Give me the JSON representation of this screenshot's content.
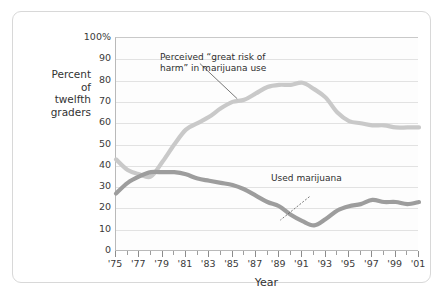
{
  "figure": {
    "y_axis_title_lines": [
      "Percent",
      "of",
      "twelfth",
      "graders"
    ],
    "x_axis_title": "Year",
    "annotations": {
      "risk": "Perceived “great risk of\nharm” in marijuana use",
      "use": "Used marijuana"
    }
  },
  "colors": {
    "risk_line": "#c9c9c9",
    "use_line": "#9d9d9d",
    "grid": "#e2e2e2",
    "axis": "#b9b9b9",
    "frame": "#d8d8d8",
    "text": "#3a3a3a",
    "plot_background": "#fdfdfd"
  },
  "chart_data": {
    "type": "line",
    "title": "",
    "subtitle": "",
    "xlabel": "Year",
    "ylabel": "Percent of twelfth graders",
    "xlim": [
      1975,
      2001
    ],
    "ylim": [
      0,
      100
    ],
    "grid": true,
    "legend_position": "inline-annotations",
    "ytick_labels": [
      "100%",
      "90",
      "80",
      "70",
      "60",
      "50",
      "40",
      "30",
      "20",
      "10",
      "0"
    ],
    "ytick_values": [
      100,
      90,
      80,
      70,
      60,
      50,
      40,
      30,
      20,
      10,
      0
    ],
    "xtick_labels": [
      "'75",
      "'77",
      "'79",
      "'81",
      "'83",
      "'85",
      "'87",
      "'89",
      "'91",
      "'93",
      "'95",
      "'97",
      "'99",
      "'01"
    ],
    "xtick_values": [
      1975,
      1977,
      1979,
      1981,
      1983,
      1985,
      1987,
      1989,
      1991,
      1993,
      1995,
      1997,
      1999,
      2001
    ],
    "x": [
      1975,
      1976,
      1977,
      1978,
      1979,
      1980,
      1981,
      1982,
      1983,
      1984,
      1985,
      1986,
      1987,
      1988,
      1989,
      1990,
      1991,
      1992,
      1993,
      1994,
      1995,
      1996,
      1997,
      1998,
      1999,
      2000,
      2001
    ],
    "series": [
      {
        "name": "Perceived “great risk of harm” in marijuana use",
        "color": "#c9c9c9",
        "values": [
          43,
          38,
          36,
          35,
          42,
          50,
          57,
          60,
          63,
          67,
          70,
          71,
          74,
          77,
          78,
          78,
          79,
          76,
          72,
          65,
          61,
          60,
          59,
          59,
          58,
          58,
          58
        ]
      },
      {
        "name": "Used marijuana",
        "color": "#9d9d9d",
        "values": [
          27,
          32,
          35,
          37,
          37,
          37,
          36,
          34,
          33,
          32,
          31,
          29,
          26,
          23,
          21,
          17,
          14,
          12,
          15,
          19,
          21,
          22,
          24,
          23,
          23,
          22,
          23
        ]
      }
    ],
    "annotations": [
      {
        "text": "Perceived “great risk of harm” in marijuana use",
        "points_to_year": 1985,
        "points_to_value": 70
      },
      {
        "text": "Used marijuana",
        "points_to_year": 1992,
        "points_to_value": 12
      }
    ]
  }
}
